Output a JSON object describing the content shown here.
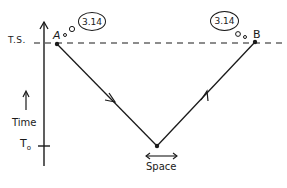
{
  "diagram": {
    "type": "spacetime-diagram",
    "axes": {
      "vertical_label": "Time",
      "horizontal_label": "Space",
      "ticks": [
        {
          "label": "T.S.",
          "position": "top"
        },
        {
          "label": "T",
          "subscript": "o",
          "position": "bottom"
        }
      ]
    },
    "points": [
      {
        "label": "A",
        "thought": "3.14"
      },
      {
        "label": "B",
        "thought": "3.14"
      }
    ],
    "lines": [
      {
        "from": "A",
        "to": "vertex",
        "style": "solid",
        "arrow": "forward"
      },
      {
        "from": "vertex",
        "to": "B",
        "style": "solid",
        "arrow": "forward"
      },
      {
        "from": "left",
        "to": "right",
        "style": "dashed",
        "at": "T.S."
      }
    ]
  },
  "labels": {
    "ts": "T.S.",
    "time": "Time",
    "t0_main": "T",
    "t0_sub": "o",
    "space": "Space",
    "point_a": "A",
    "point_b": "B",
    "bubble_a": "3.14",
    "bubble_b": "3.14"
  },
  "colors": {
    "ink": "#1a1a1a",
    "background": "#ffffff"
  }
}
